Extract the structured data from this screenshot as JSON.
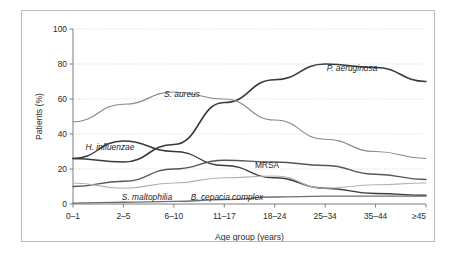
{
  "chart_data": {
    "type": "line",
    "title": "",
    "xlabel": "Age group (years)",
    "ylabel": "Patients (%)",
    "categories": [
      "0–1",
      "2–5",
      "6–10",
      "11–17",
      "18–24",
      "25–34",
      "35–44",
      "≥45"
    ],
    "ylim": [
      0,
      100
    ],
    "yticks": [
      0,
      20,
      40,
      60,
      80,
      100
    ],
    "ytick_labels": [
      "0",
      "20",
      "40",
      "60",
      "80",
      "100"
    ],
    "grid": "horizontal-dotted",
    "legend": "inline-labels",
    "series": [
      {
        "name": "P. aeruginosa",
        "italic": true,
        "color": "#3a3a3a",
        "width": 1.6,
        "values": [
          26,
          24,
          34,
          58,
          71,
          80,
          78,
          70
        ],
        "label_x": 330,
        "label_y": 60
      },
      {
        "name": "S. aureus",
        "italic": true,
        "color": "#8a8a8a",
        "width": 1.2,
        "values": [
          47,
          57,
          64,
          60,
          48,
          37,
          30,
          26
        ],
        "label_x": 160,
        "label_y": 86
      },
      {
        "name": "H. influenzae",
        "italic": true,
        "color": "#3a3a3a",
        "width": 1.4,
        "values": [
          26,
          36,
          30,
          22,
          15,
          9,
          6,
          5
        ],
        "label_x": 88,
        "label_y": 139
      },
      {
        "name": "MRSA",
        "italic": false,
        "color": "#555555",
        "width": 1.3,
        "values": [
          10,
          13,
          20,
          25,
          24,
          22,
          17,
          14
        ],
        "label_x": 245,
        "label_y": 157
      },
      {
        "name": "S. maltophilia",
        "italic": true,
        "color": "#b3b3b3",
        "width": 1.2,
        "values": [
          12,
          9,
          12,
          15,
          16,
          9,
          11,
          12
        ],
        "label_x": 125,
        "label_y": 189
      },
      {
        "name": "B. cepacia complex",
        "italic": true,
        "color": "#6e6e6e",
        "width": 1.3,
        "values": [
          0.5,
          1,
          1.5,
          2.5,
          4,
          4.5,
          4.5,
          4.5
        ],
        "label_x": 205,
        "label_y": 189
      }
    ]
  },
  "frame": {
    "border_color": "#b9b9b9",
    "background": "#ffffff"
  }
}
